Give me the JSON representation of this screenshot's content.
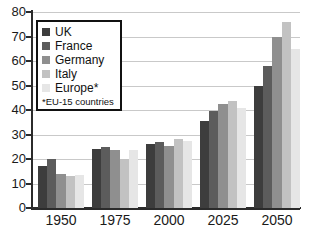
{
  "chart_data": {
    "type": "bar",
    "title": "",
    "subtitle": "",
    "xlabel": "",
    "ylabel": "",
    "categories": [
      "1950",
      "1975",
      "2000",
      "2025",
      "2050"
    ],
    "ylim": [
      0,
      80
    ],
    "yticks": [
      0,
      10,
      20,
      30,
      40,
      50,
      60,
      70,
      80
    ],
    "ytick_labels": [
      "0",
      "10",
      "20",
      "30",
      "40",
      "50",
      "60",
      "70",
      "80"
    ],
    "grid": true,
    "legend_position": "upper-left",
    "legend_note": "*EU-15 countries",
    "series": [
      {
        "name": "UK",
        "color": "#3d3d3d",
        "values": [
          17.0,
          24.0,
          26.0,
          35.5,
          50.0
        ]
      },
      {
        "name": "France",
        "color": "#5c5c5c",
        "values": [
          20.0,
          24.8,
          26.8,
          39.5,
          58.0
        ]
      },
      {
        "name": "Germany",
        "color": "#8f8f8f",
        "values": [
          14.0,
          23.5,
          25.5,
          42.5,
          70.0
        ]
      },
      {
        "name": "Italy",
        "color": "#c2c2c2",
        "values": [
          13.0,
          20.0,
          28.0,
          43.5,
          76.0
        ]
      },
      {
        "name": "Europe*",
        "color": "#e6e6e6",
        "values": [
          13.5,
          23.5,
          27.5,
          41.0,
          65.0
        ]
      }
    ]
  },
  "legend": {
    "entries": [
      {
        "label": "UK"
      },
      {
        "label": "France"
      },
      {
        "label": "Germany"
      },
      {
        "label": "Italy"
      },
      {
        "label": "Europe*"
      }
    ],
    "note": "*EU-15 countries"
  }
}
